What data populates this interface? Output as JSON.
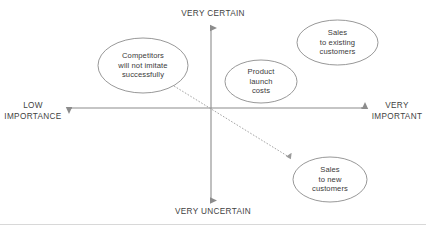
{
  "diagram": {
    "type": "quadrant-matrix",
    "colors": {
      "stroke": "#8c8c8c",
      "text": "#3a3a3a",
      "background": "#ffffff",
      "connector": "#9a9a9a",
      "footer_rule": "#d8d8d8"
    },
    "axes": {
      "vertical": {
        "top_label_line1": "VERY CERTAIN",
        "bottom_label_line1": "VERY UNCERTAIN"
      },
      "horizontal": {
        "left_label_line1": "LOW",
        "left_label_line2": "IMPORTANCE",
        "right_label_line1": "VERY",
        "right_label_line2": "IMPORTANT"
      }
    },
    "nodes": [
      {
        "id": "competitors",
        "lines": [
          "Competitors",
          "will not imitate",
          "successfully"
        ],
        "quadrant": "certain-low-importance"
      },
      {
        "id": "product-launch-costs",
        "lines": [
          "Product",
          "launch",
          "costs"
        ],
        "quadrant": "certain-important"
      },
      {
        "id": "sales-existing-customers",
        "lines": [
          "Sales",
          "to existing",
          "customers"
        ],
        "quadrant": "certain-very-important"
      },
      {
        "id": "sales-new-customers",
        "lines": [
          "Sales",
          "to new",
          "customers"
        ],
        "quadrant": "uncertain-very-important"
      }
    ],
    "connector": {
      "from": "competitors",
      "to": "sales-new-customers",
      "style": "dashed-arrow"
    }
  }
}
